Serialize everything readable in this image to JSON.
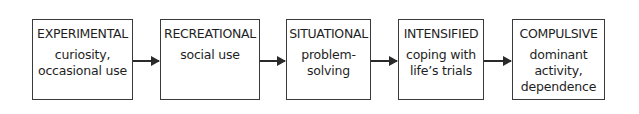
{
  "diagram": {
    "type": "flow",
    "stages": [
      {
        "title": "EXPERIMENTAL",
        "lines": [
          "curiosity,",
          "occasional use"
        ]
      },
      {
        "title": "RECREATIONAL",
        "lines": [
          "social use"
        ]
      },
      {
        "title": "SITUATIONAL",
        "lines": [
          "problem-",
          "solving"
        ]
      },
      {
        "title": "INTENSIFIED",
        "lines": [
          "coping with",
          "life’s trials"
        ]
      },
      {
        "title": "COMPULSIVE",
        "lines": [
          "dominant",
          "activity,",
          "dependence"
        ]
      }
    ]
  }
}
